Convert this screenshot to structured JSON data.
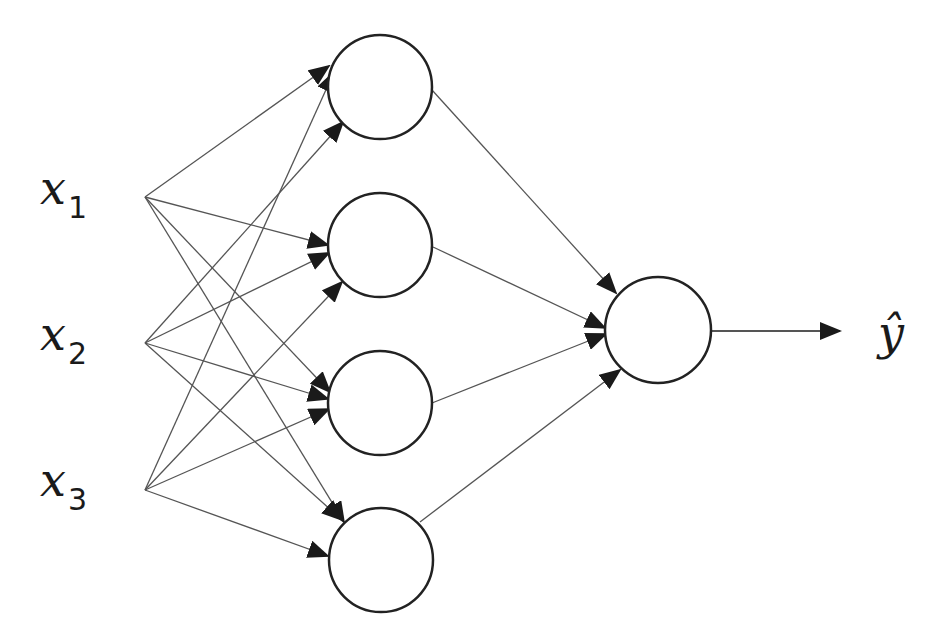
{
  "diagram": {
    "type": "neural-network",
    "inputs": [
      {
        "id": "x1",
        "var": "x",
        "sub": "1"
      },
      {
        "id": "x2",
        "var": "x",
        "sub": "2"
      },
      {
        "id": "x3",
        "var": "x",
        "sub": "3"
      }
    ],
    "hidden_layer": {
      "node_count": 4
    },
    "output": {
      "node_count": 1,
      "label": "ŷ"
    },
    "connections": "fully-connected inputs→hidden, hidden→output, output→ŷ",
    "colors": {
      "stroke": "#222222",
      "edge": "#555555",
      "background": "#ffffff"
    }
  }
}
